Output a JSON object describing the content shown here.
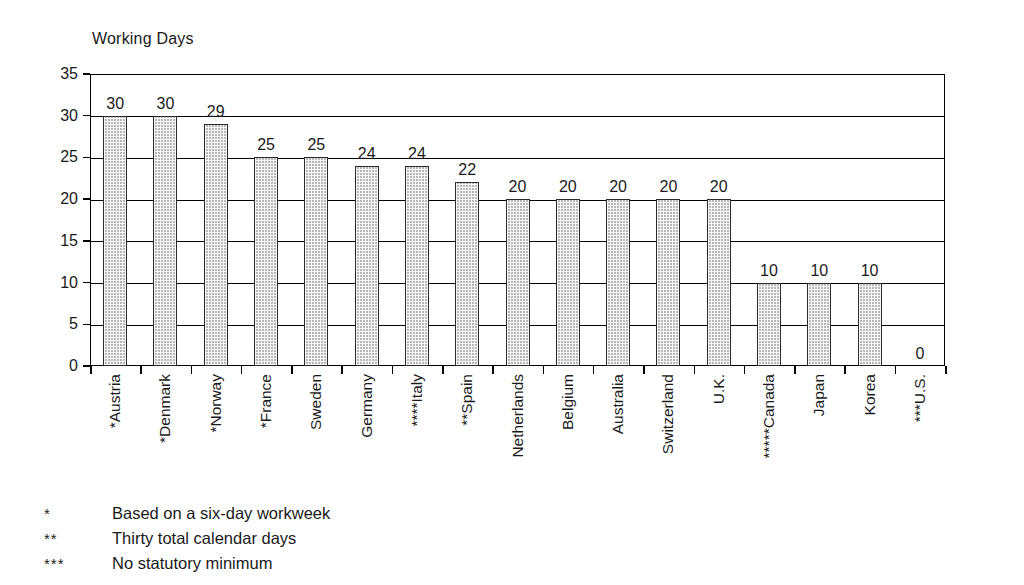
{
  "chart_data": {
    "type": "bar",
    "title": "",
    "ylabel": "Working Days",
    "xlabel": "",
    "ylim": [
      0,
      35
    ],
    "yticks": [
      0,
      5,
      10,
      15,
      20,
      25,
      30,
      35
    ],
    "grid": true,
    "legend": "none",
    "categories": [
      "*Austria",
      "*Denmark",
      "*Norway",
      "*France",
      "Sweden",
      "Germany",
      "****Italy",
      "**Spain",
      "Netherlands",
      "Belgium",
      "Australia",
      "Switzerland",
      "U.K.",
      "*****Canada",
      "Japan",
      "Korea",
      "***U.S."
    ],
    "values": [
      30,
      30,
      29,
      25,
      25,
      24,
      24,
      22,
      20,
      20,
      20,
      20,
      20,
      10,
      10,
      10,
      0
    ],
    "value_labels": [
      "30",
      "30",
      "29",
      "25",
      "25",
      "24",
      "24",
      "22",
      "20",
      "20",
      "20",
      "20",
      "20",
      "10",
      "10",
      "10",
      "0"
    ],
    "bar_color": "#b9b9b9",
    "bar_border_color": "#2b2b2b",
    "axis_color": "#000000"
  },
  "axis": {
    "y_title": "Working Days",
    "y_tick_labels": [
      "35",
      "30",
      "25",
      "20",
      "15",
      "10",
      "5",
      "0"
    ]
  },
  "footnotes": [
    {
      "marker": "*",
      "text": "Based on a six-day workweek"
    },
    {
      "marker": "**",
      "text": "Thirty total calendar days"
    },
    {
      "marker": "***",
      "text": "No statutory minimum"
    }
  ]
}
